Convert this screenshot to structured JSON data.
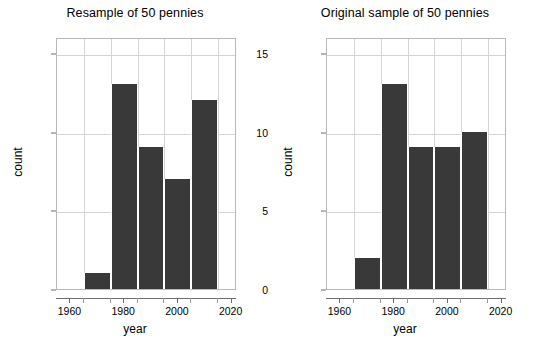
{
  "figure": {
    "background": "#ffffff",
    "bar_color": "#393939",
    "grid_color": "#d4d4d4",
    "frame_color": "#b9b9b9"
  },
  "panels": [
    {
      "title": "Resample of 50 pennies",
      "xlabel": "year",
      "ylabel": "count"
    },
    {
      "title": "Original sample of 50 pennies",
      "xlabel": "year",
      "ylabel": "count"
    }
  ],
  "axes": {
    "xticks": [
      "1960",
      "1980",
      "2000",
      "2020"
    ],
    "yticks": [
      "0",
      "5",
      "10",
      "15"
    ]
  },
  "chart_data": [
    {
      "type": "bar",
      "title": "Resample of 50 pennies",
      "xlabel": "year",
      "ylabel": "count",
      "categories": [
        "1965-1975",
        "1975-1985",
        "1985-1995",
        "1995-2005",
        "2005-2015"
      ],
      "bin_edges": [
        1965,
        1975,
        1985,
        1995,
        2005,
        2015
      ],
      "values": [
        1,
        13,
        9,
        7,
        12
      ],
      "xlim": [
        1955,
        2022
      ],
      "ylim": [
        0,
        16
      ],
      "xtick_values": [
        1960,
        1980,
        2000,
        2020
      ],
      "ytick_values": [
        0,
        5,
        10,
        15
      ],
      "grid": true,
      "legend": "none"
    },
    {
      "type": "bar",
      "title": "Original sample of 50 pennies",
      "xlabel": "year",
      "ylabel": "count",
      "categories": [
        "1965-1975",
        "1975-1985",
        "1985-1995",
        "1995-2005",
        "2005-2015"
      ],
      "bin_edges": [
        1965,
        1975,
        1985,
        1995,
        2005,
        2015
      ],
      "values": [
        2,
        13,
        9,
        9,
        10
      ],
      "xlim": [
        1955,
        2022
      ],
      "ylim": [
        0,
        16
      ],
      "xtick_values": [
        1960,
        1980,
        2000,
        2020
      ],
      "ytick_values": [
        0,
        5,
        10,
        15
      ],
      "grid": true,
      "legend": "none"
    }
  ]
}
